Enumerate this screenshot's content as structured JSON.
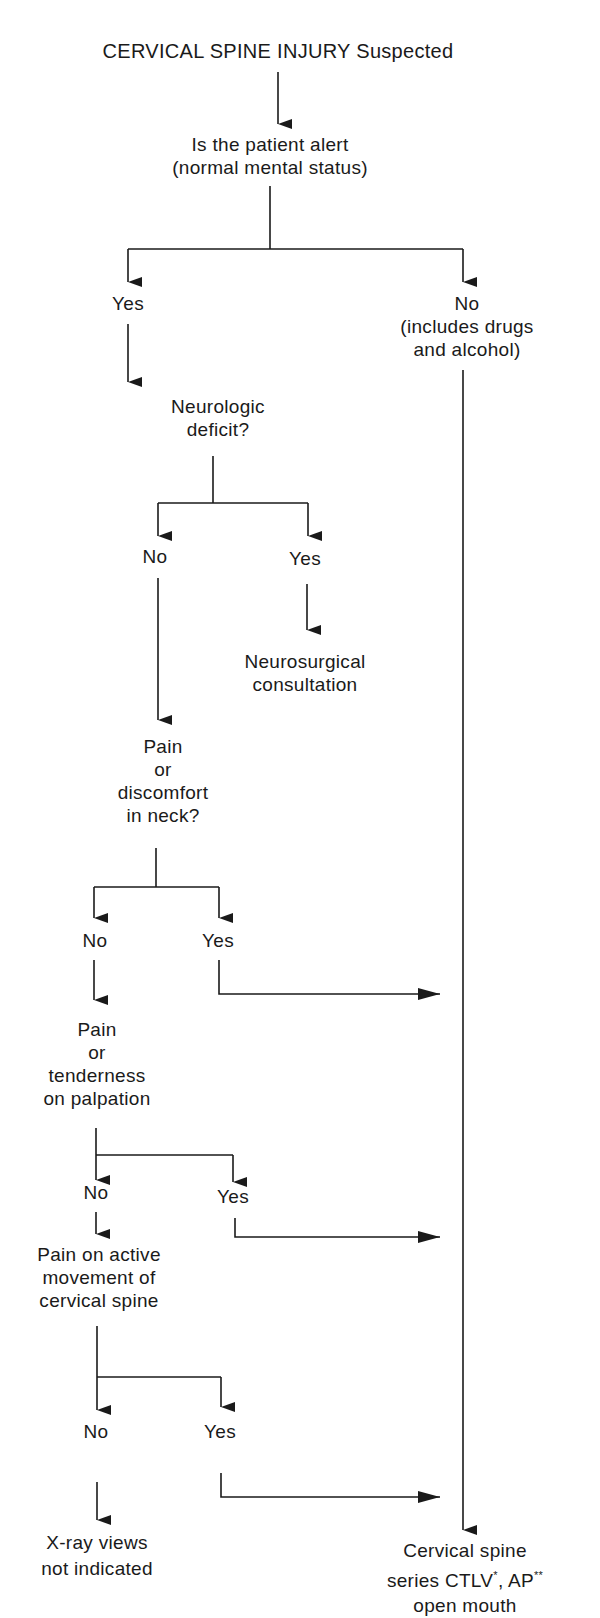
{
  "title": "CERVICAL SPINE INJURY Suspected",
  "nodes": {
    "alert_q": [
      "Is the patient alert",
      "(normal mental status)"
    ],
    "alert_yes": "Yes",
    "alert_no": [
      "No",
      "(includes drugs",
      "and alcohol)"
    ],
    "neuro_q": [
      "Neurologic",
      "deficit?"
    ],
    "neuro_no": "No",
    "neuro_yes": "Yes",
    "neuro_consult": [
      "Neurosurgical",
      "consultation"
    ],
    "pain_neck_q": [
      "Pain",
      "or",
      "discomfort",
      "in neck?"
    ],
    "pain_neck_no": "No",
    "pain_neck_yes": "Yes",
    "palpation_q": [
      "Pain",
      "or",
      "tenderness",
      "on palpation"
    ],
    "palpation_no": "No",
    "palpation_yes": "Yes",
    "movement_q": [
      "Pain on active",
      "movement of",
      "cervical spine"
    ],
    "movement_no": "No",
    "movement_yes": "Yes",
    "xray_not": [
      "X-ray views",
      "not indicated"
    ],
    "cspine_series": {
      "line1": "Cervical spine",
      "line2_pre": "series CTLV",
      "line2_sup1": "*",
      "line2_mid": ", AP",
      "line2_sup2": "**",
      "line3": "open mouth"
    }
  },
  "colors": {
    "ink": "#1a1a1a",
    "background": "#ffffff"
  }
}
